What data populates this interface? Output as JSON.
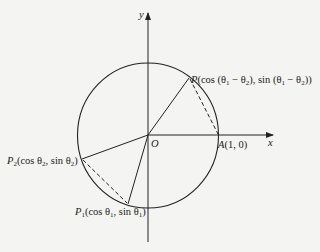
{
  "figure": {
    "axes": {
      "x_label": "x",
      "y_label": "y",
      "origin_label": "O"
    },
    "circle": {
      "type": "unit-circle",
      "center": "O",
      "radius": 1
    },
    "points": {
      "A": {
        "name": "A",
        "coords": "(1, 0)"
      },
      "P": {
        "name": "P",
        "coords": "(cos (θ",
        "s1": "1",
        "m1": " − θ",
        "s2": "2",
        "m2": "), sin (θ",
        "s3": "1",
        "m3": " − θ",
        "s4": "2",
        "end": "))"
      },
      "P1": {
        "name": "P",
        "sub": "1",
        "t1": "(cos θ",
        "s1": "1",
        "t2": ", sin θ",
        "s2": "1",
        "t3": ")"
      },
      "P2": {
        "name": "P",
        "sub": "2",
        "t1": "(cos θ",
        "s1": "2",
        "t2": ", sin θ",
        "s2": "2",
        "t3": ")"
      }
    },
    "segments": {
      "solid": [
        "OP",
        "OA",
        "OP1",
        "OP2"
      ],
      "dashed": [
        "PA",
        "P1P2"
      ]
    }
  }
}
